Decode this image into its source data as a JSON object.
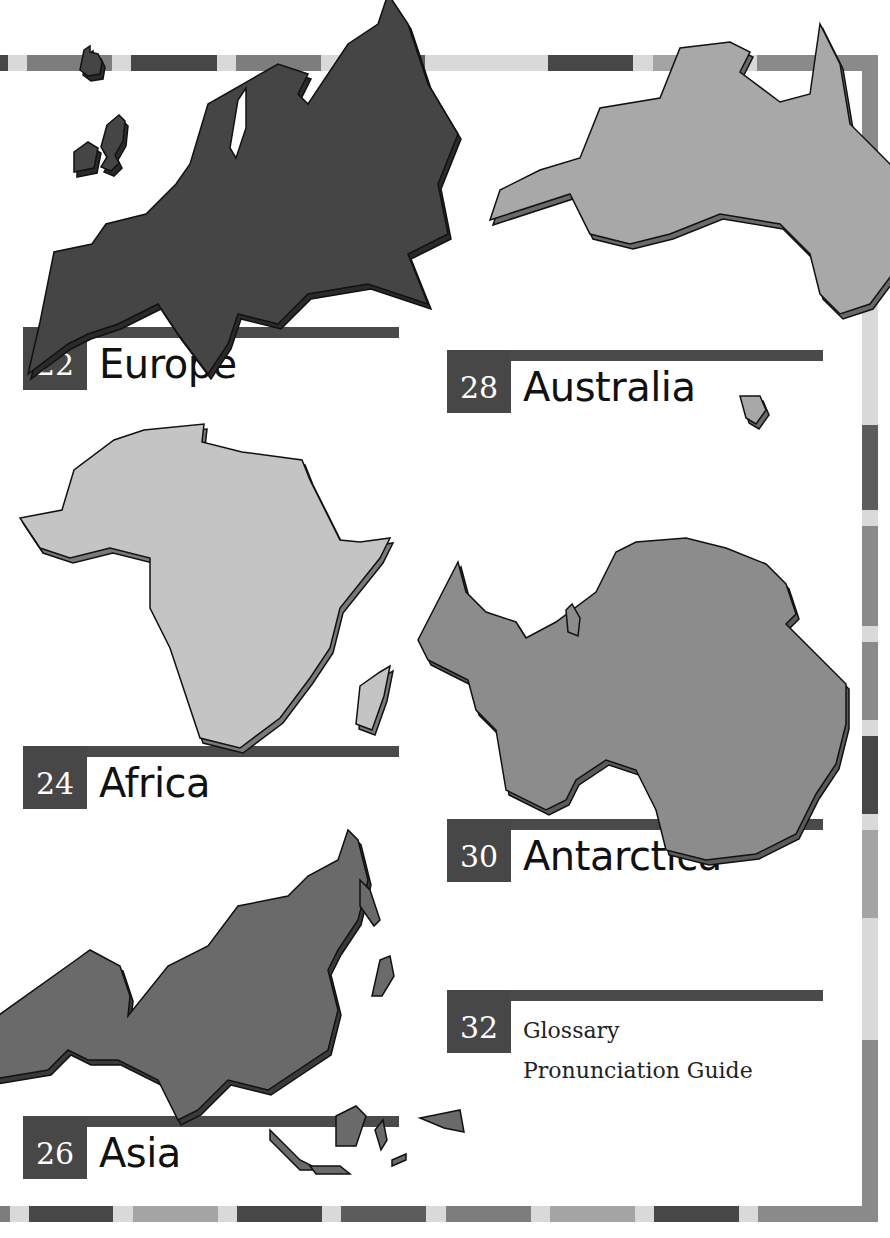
{
  "page": {
    "type": "table-of-contents",
    "palette": {
      "dark": "#474747",
      "darkmid": "#5c5c5c",
      "mid": "#7d7d7d",
      "midlight": "#a4a4a4",
      "light": "#d9d9d9",
      "europe_fill": "#454545",
      "australia_fill": "#a8a8a8",
      "africa_fill": "#c4c4c4",
      "antarctica_fill": "#8c8c8c",
      "asia_fill": "#6a6a6a"
    }
  },
  "entries": [
    {
      "page": "22",
      "title": "Europe",
      "map": "europe-map"
    },
    {
      "page": "28",
      "title": "Australia",
      "map": "australia-map"
    },
    {
      "page": "24",
      "title": "Africa",
      "map": "africa-map"
    },
    {
      "page": "30",
      "title": "Antarctica",
      "map": "antarctica-map"
    },
    {
      "page": "26",
      "title": "Asia",
      "map": "asia-map"
    },
    {
      "page": "32",
      "title": "Glossary",
      "subtitle": "Pronunciation Guide"
    }
  ]
}
